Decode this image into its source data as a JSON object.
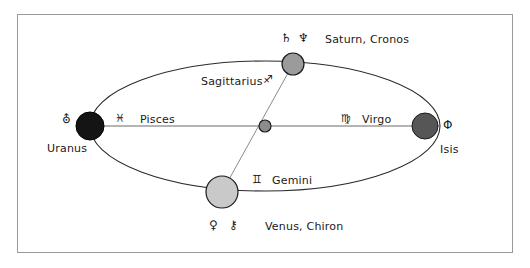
{
  "diagram": {
    "background_color": "#ffffff",
    "frame_color": "#9a9a9a",
    "line_color": "#555555",
    "ellipse_stroke": "#2b2b2b",
    "text_color": "#1a1a1a"
  },
  "nodes": [
    {
      "id": "uranus",
      "body_label": "Uranus",
      "body_glyph": "⛢",
      "fill": "#141414",
      "stroke": "#000000",
      "radius": 14
    },
    {
      "id": "isis",
      "body_label": "Isis",
      "body_glyph": "Φ",
      "fill": "#565656",
      "stroke": "#1a1a1a",
      "radius": 13
    },
    {
      "id": "saturn",
      "body_label": "Saturn, Cronos",
      "body_glyph_1": "♄",
      "body_glyph_2": "♆",
      "fill": "#9b9b9b",
      "stroke": "#1a1a1a",
      "radius": 11
    },
    {
      "id": "venus",
      "body_label": "Venus, Chiron",
      "body_glyph_1": "♀",
      "body_glyph_2": "⚷",
      "fill": "#c9c9c9",
      "stroke": "#1a1a1a",
      "radius": 16
    },
    {
      "id": "center",
      "body_label": "",
      "fill": "#8c8c8c",
      "stroke": "#1a1a1a",
      "radius": 6
    }
  ],
  "signs": [
    {
      "id": "pisces",
      "glyph": "♓",
      "label": "Pisces"
    },
    {
      "id": "virgo",
      "glyph": "♍",
      "label": "Virgo"
    },
    {
      "id": "sagittarius",
      "glyph": "♐",
      "label": "Sagittarius"
    },
    {
      "id": "gemini",
      "glyph": "♊",
      "label": "Gemini"
    }
  ]
}
